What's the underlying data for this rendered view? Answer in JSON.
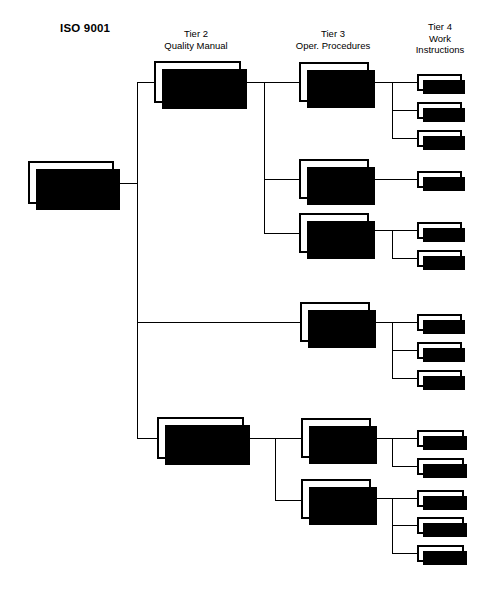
{
  "diagram": {
    "title": "ISO 9001",
    "type": "hierarchy-tree",
    "width": 483,
    "height": 589,
    "background_color": "#ffffff",
    "line_color": "#000000",
    "box_fill": "#ffffff",
    "box_border_color": "#000000",
    "shadow_color": "#000000"
  },
  "column_headers": [
    {
      "id": "tier2",
      "lines": [
        "Tier 2",
        "Quality Manual"
      ],
      "line1": "Tier 2",
      "line2": "Quality Manual",
      "line3": ""
    },
    {
      "id": "tier3",
      "lines": [
        "Tier 3",
        "Oper. Procedures"
      ],
      "line1": "Tier 3",
      "line2": "Oper. Procedures",
      "line3": ""
    },
    {
      "id": "tier4",
      "lines": [
        "Tier 4",
        "Work",
        "Instructions"
      ],
      "line1": "Tier 4",
      "line2": "Work",
      "line3": "Instructions"
    }
  ],
  "nodes": {
    "root": {
      "label": "4.1"
    },
    "tier2": [
      {
        "id": "qm1",
        "label": "QM 1"
      },
      {
        "id": "qm2",
        "label": "QM 2"
      }
    ],
    "tier3": [
      {
        "id": "p1",
        "label": "P1"
      },
      {
        "id": "p2",
        "label": "P2"
      },
      {
        "id": "p3",
        "label": "P3"
      },
      {
        "id": "p4",
        "label": "P4"
      },
      {
        "id": "p5",
        "label": "P5"
      },
      {
        "id": "p6",
        "label": "P6"
      }
    ],
    "tier4": [
      {
        "id": "w1",
        "label": "W1"
      },
      {
        "id": "w2",
        "label": "W2"
      },
      {
        "id": "w3",
        "label": "W3"
      },
      {
        "id": "w4",
        "label": "W4"
      },
      {
        "id": "w5",
        "label": "W5"
      },
      {
        "id": "w6",
        "label": "W6"
      },
      {
        "id": "w7",
        "label": "W7"
      },
      {
        "id": "w8",
        "label": "W8"
      },
      {
        "id": "w9",
        "label": "W9"
      },
      {
        "id": "w10",
        "label": "W10"
      },
      {
        "id": "w11",
        "label": "W11"
      },
      {
        "id": "w12",
        "label": "W12"
      },
      {
        "id": "w13",
        "label": "W13"
      },
      {
        "id": "w14",
        "label": "W14"
      }
    ]
  },
  "edges": [
    {
      "from": "4.1",
      "to": "QM 1"
    },
    {
      "from": "4.1",
      "to": "P4"
    },
    {
      "from": "4.1",
      "to": "QM 2"
    },
    {
      "from": "QM 1",
      "to": "P1"
    },
    {
      "from": "QM 1",
      "to": "P2"
    },
    {
      "from": "QM 1",
      "to": "P3"
    },
    {
      "from": "P1",
      "to": "W1"
    },
    {
      "from": "P1",
      "to": "W2"
    },
    {
      "from": "P1",
      "to": "W3"
    },
    {
      "from": "P2",
      "to": "W4"
    },
    {
      "from": "P3",
      "to": "W5"
    },
    {
      "from": "P3",
      "to": "W6"
    },
    {
      "from": "P4",
      "to": "W7"
    },
    {
      "from": "P4",
      "to": "W8"
    },
    {
      "from": "P4",
      "to": "W9"
    },
    {
      "from": "QM 2",
      "to": "P5"
    },
    {
      "from": "QM 2",
      "to": "P6"
    },
    {
      "from": "P5",
      "to": "W10"
    },
    {
      "from": "P5",
      "to": "W11"
    },
    {
      "from": "P6",
      "to": "W12"
    },
    {
      "from": "P6",
      "to": "W13"
    },
    {
      "from": "P6",
      "to": "W14"
    }
  ]
}
